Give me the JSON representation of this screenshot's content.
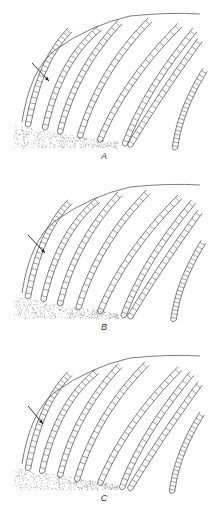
{
  "figure": {
    "panels": [
      {
        "id": "A",
        "label": "A",
        "top": 0,
        "label_x": 94,
        "label_y": 151,
        "arrow": {
          "x1": 32,
          "y1": 63,
          "x2": 49,
          "y2": 81
        }
      },
      {
        "id": "B",
        "label": "B",
        "top": 171,
        "label_x": 94,
        "label_y": 151,
        "arrow": {
          "x1": 28,
          "y1": 64,
          "x2": 45,
          "y2": 82
        }
      },
      {
        "id": "C",
        "label": "C",
        "top": 342,
        "label_x": 94,
        "label_y": 151,
        "arrow": {
          "x1": 28,
          "y1": 64,
          "x2": 43,
          "y2": 82
        }
      }
    ],
    "colors": {
      "line": "#444444",
      "stipple": "#888888",
      "background": "#ffffff"
    }
  }
}
